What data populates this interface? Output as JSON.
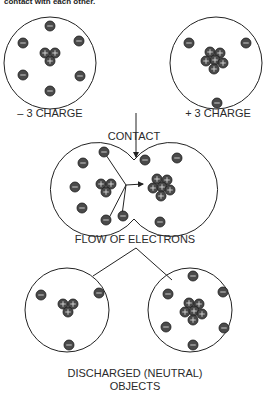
{
  "header": {
    "caption_fragment": "contact with each other."
  },
  "labels": {
    "left_object": "– 3 CHARGE",
    "right_object": "+ 3 CHARGE",
    "contact": "CONTACT",
    "flow": "FLOW OF ELECTRONS",
    "discharged_line1": "DISCHARGED (NEUTRAL)",
    "discharged_line2": "OBJECTS"
  },
  "symbols": {
    "electron": "−",
    "proton": "+"
  },
  "objects": {
    "charged_negative": {
      "protons": 3,
      "electrons": 6,
      "net_charge": -3
    },
    "charged_positive": {
      "protons": 6,
      "electrons": 3,
      "net_charge": 3
    },
    "neutral_left": {
      "protons": 3,
      "electrons": 3,
      "net_charge": 0
    },
    "neutral_right": {
      "protons": 6,
      "electrons": 6,
      "net_charge": 0
    }
  },
  "colors": {
    "particle_fill": "#4a4a4a",
    "particle_stroke": "#1a1a1a",
    "line": "#222222"
  }
}
